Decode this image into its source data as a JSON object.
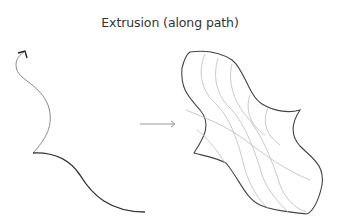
{
  "diagram": {
    "title": "Extrusion (along path)",
    "left_panel": {
      "path_curve": "wavy path with arrowhead pointing up",
      "profile_curve": "S-shaped profile curve"
    },
    "arrow": "right-arrow",
    "right_panel": {
      "surface": "extruded surface grid along path"
    },
    "colors": {
      "profile_stroke": "#333333",
      "path_stroke": "#888888",
      "grid_stroke": "#bbbbbb"
    }
  }
}
